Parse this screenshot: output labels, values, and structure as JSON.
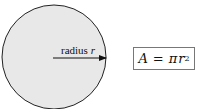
{
  "diagram": {
    "circle": {
      "cx": 54,
      "cy": 57,
      "r": 52,
      "fill": "#e8e8e8",
      "stroke": "#222222"
    },
    "radius_arrow": {
      "x1": 53,
      "y1": 58,
      "x2": 106,
      "y2": 58
    },
    "radius_label": {
      "text": "radius ",
      "var": "r"
    },
    "formula": {
      "lhs": "A",
      "eq": "=",
      "pi": "π",
      "var": "r",
      "exp": "2"
    }
  }
}
